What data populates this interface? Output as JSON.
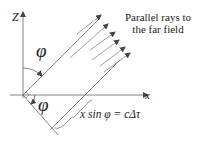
{
  "diagram": {
    "axis_z_label": "Z",
    "axis_x_label": "x",
    "angle_upper_label": "φ",
    "angle_lower_label": "φ",
    "caption_line1": "Parallel rays to",
    "caption_line2": "the far field",
    "equation": "x sin φ = cΔτ",
    "colors": {
      "line": "#555555",
      "text": "#222222",
      "background": "#ffffff"
    }
  }
}
